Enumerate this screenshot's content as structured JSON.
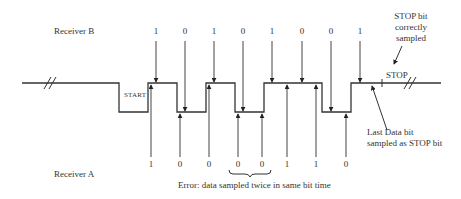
{
  "receiver_b": {
    "label": "Receiver B",
    "bits": [
      {
        "value": "1",
        "x": 156
      },
      {
        "value": "0",
        "x": 185
      },
      {
        "value": "1",
        "x": 214
      },
      {
        "value": "0",
        "x": 243
      },
      {
        "value": "1",
        "x": 272
      },
      {
        "value": "0",
        "x": 302
      },
      {
        "value": "0",
        "x": 331
      },
      {
        "value": "1",
        "x": 360
      }
    ]
  },
  "receiver_a": {
    "label": "Receiver A",
    "bits": [
      {
        "value": "1",
        "x": 150
      },
      {
        "value": "0",
        "x": 179
      },
      {
        "value": "0",
        "x": 209
      },
      {
        "value": "0",
        "x": 238
      },
      {
        "value": "0",
        "x": 262
      },
      {
        "value": "1",
        "x": 292
      },
      {
        "value": "1",
        "x": 321
      },
      {
        "value": "0",
        "x": 350
      }
    ]
  },
  "signal": {
    "start_label": "START",
    "stop_label": "STOP"
  },
  "annotations": {
    "stop_correct_line1": "STOP bit",
    "stop_correct_line2": "correctly",
    "stop_correct_line3": "sampled",
    "last_data_line1": "Last Data bit",
    "last_data_line2": "sampled as STOP bit",
    "error": "Error: data sampled twice in same bit time"
  }
}
